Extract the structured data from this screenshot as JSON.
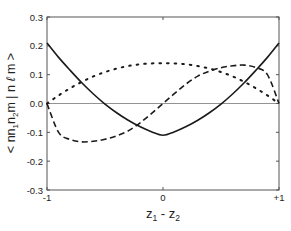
{
  "chart_data": {
    "type": "line",
    "title": "",
    "xlabel": "z₁ - z₂",
    "xlabel_parts": {
      "main1": "z",
      "sub1": "1",
      "mid": " - z",
      "sub2": "2"
    },
    "ylabel": "< nn₁n₂m | n ℓ m >",
    "ylabel_parts": {
      "pre": "< nn",
      "sub1": "1",
      "mid": "n",
      "sub2": "2",
      "post": "m | n ",
      "ell": "ℓ",
      "end": " m >"
    },
    "xlim": [
      -1,
      1
    ],
    "ylim": [
      -0.3,
      0.3
    ],
    "x_ticks": [
      -1,
      0,
      1
    ],
    "x_tick_labels": [
      "-1",
      "0",
      "+1"
    ],
    "y_ticks": [
      0.3,
      0.2,
      0.1,
      0.0,
      -0.1,
      -0.2,
      -0.3
    ],
    "y_tick_labels": [
      "0.3",
      "0.2",
      "0.1",
      "0.0",
      "-0.1",
      "-0.2",
      "-0.3"
    ],
    "grid": false,
    "zero_line": true,
    "legend": null,
    "x": [
      -1.0,
      -0.9,
      -0.8,
      -0.7,
      -0.6,
      -0.5,
      -0.4,
      -0.3,
      -0.2,
      -0.1,
      0.0,
      0.1,
      0.2,
      0.3,
      0.4,
      0.5,
      0.6,
      0.7,
      0.8,
      0.9,
      1.0
    ],
    "series": [
      {
        "name": "solid",
        "style": "solid",
        "values": [
          0.21,
          0.16,
          0.115,
          0.072,
          0.033,
          -0.002,
          -0.032,
          -0.058,
          -0.08,
          -0.098,
          -0.11,
          -0.098,
          -0.08,
          -0.058,
          -0.032,
          -0.002,
          0.033,
          0.072,
          0.115,
          0.16,
          0.21
        ]
      },
      {
        "name": "dashed",
        "style": "dashed",
        "values": [
          0.0,
          -0.1,
          -0.125,
          -0.133,
          -0.131,
          -0.124,
          -0.112,
          -0.095,
          -0.068,
          -0.035,
          0.0,
          0.035,
          0.068,
          0.095,
          0.112,
          0.124,
          0.131,
          0.133,
          0.125,
          0.1,
          0.0
        ]
      },
      {
        "name": "dotted",
        "style": "dotted",
        "values": [
          0.0,
          0.028,
          0.053,
          0.075,
          0.094,
          0.109,
          0.121,
          0.13,
          0.136,
          0.139,
          0.14,
          0.139,
          0.136,
          0.13,
          0.121,
          0.109,
          0.094,
          0.075,
          0.053,
          0.028,
          0.0
        ]
      }
    ]
  }
}
